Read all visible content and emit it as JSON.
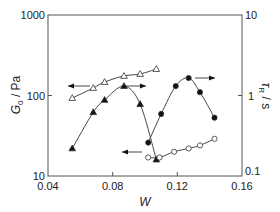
{
  "chart_data": {
    "type": "line",
    "title": "",
    "xlabel": "W",
    "ylabel_left": "G0 / Pa",
    "ylabel_right": "τR / s",
    "xlim": [
      0.04,
      0.16
    ],
    "ylim_left": [
      10,
      1000
    ],
    "ylim_right": [
      0.1,
      10
    ],
    "yscale": "log",
    "grid": false,
    "x_ticks": [
      "0.04",
      "0.08",
      "0.12",
      "0.16"
    ],
    "y_ticks_left": [
      "10",
      "100",
      "1000"
    ],
    "y_ticks_right": [
      "0.1",
      "1",
      "10"
    ],
    "series": [
      {
        "name": "G0 (open triangles)",
        "axis": "left",
        "marker": "open-triangle",
        "arrow": "left",
        "x": [
          0.055,
          0.068,
          0.075,
          0.087,
          0.097,
          0.107
        ],
        "values": [
          93,
          124,
          147,
          175,
          185,
          213
        ]
      },
      {
        "name": "τR (filled triangles)",
        "axis": "right",
        "marker": "filled-triangle",
        "arrow": "right",
        "x": [
          0.055,
          0.068,
          0.075,
          0.087,
          0.097,
          0.107
        ],
        "values": [
          0.22,
          0.62,
          0.88,
          1.31,
          0.78,
          0.16
        ]
      },
      {
        "name": "τR (filled circles)",
        "axis": "right",
        "marker": "filled-circle",
        "arrow": "right",
        "x": [
          0.102,
          0.11,
          0.119,
          0.127,
          0.134,
          0.143
        ],
        "values": [
          0.26,
          0.59,
          1.31,
          1.65,
          1.1,
          0.53
        ]
      },
      {
        "name": "G0 (open circles)",
        "axis": "left",
        "marker": "open-circle",
        "arrow": "left",
        "x": [
          0.102,
          0.109,
          0.118,
          0.127,
          0.134,
          0.143
        ],
        "values": [
          17,
          17,
          20,
          22,
          24,
          29
        ]
      }
    ]
  },
  "labels": {
    "x_title": "W",
    "y_left_main": "G",
    "y_left_sub": "0",
    "y_left_unit": " / Pa",
    "y_right_main": "τ",
    "y_right_sub": "R",
    "y_right_unit": " / s",
    "x_ticks": [
      "0.04",
      "0.08",
      "0.12",
      "0.16"
    ],
    "y_left_ticks": [
      "10",
      "100",
      "1000"
    ],
    "y_right_ticks": [
      "0.1",
      "1",
      "10"
    ]
  }
}
